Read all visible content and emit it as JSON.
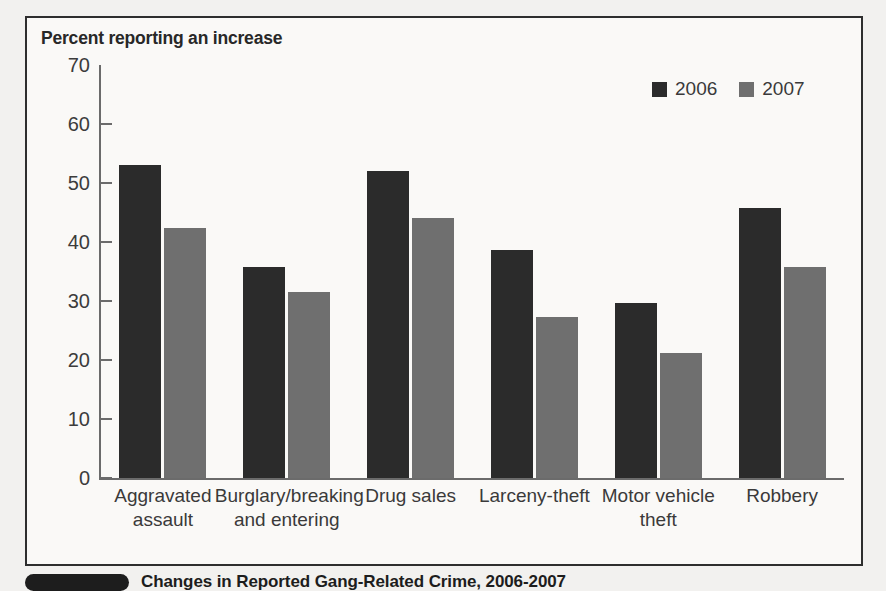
{
  "figure": {
    "plot_title": "Percent reporting an increase",
    "caption": "Changes in Reported Gang-Related Crime, 2006-2007"
  },
  "legend": {
    "items": [
      {
        "label": "2006",
        "color": "#2b2b2b",
        "icon": "square-swatch"
      },
      {
        "label": "2007",
        "color": "#6f6f6f",
        "icon": "square-swatch"
      }
    ]
  },
  "chart_data": {
    "type": "bar",
    "title": "Percent reporting an increase",
    "xlabel": "",
    "ylabel": "Percent reporting an increase",
    "ylim": [
      0,
      70
    ],
    "yticks": [
      0,
      10,
      20,
      30,
      40,
      50,
      60,
      70
    ],
    "ytick_labels": [
      "0",
      "10",
      "20",
      "30",
      "40",
      "50",
      "60",
      "70"
    ],
    "grid": false,
    "legend_position": "top-right",
    "categories": [
      "Aggravated assault",
      "Burglary/breaking and entering",
      "Drug sales",
      "Larceny-theft",
      "Motor vehicle theft",
      "Robbery"
    ],
    "category_lines": [
      [
        "Aggravated",
        "assault"
      ],
      [
        "Burglary/breaking",
        "and entering"
      ],
      [
        "Drug sales"
      ],
      [
        "Larceny-theft"
      ],
      [
        "Motor vehicle",
        "theft"
      ],
      [
        "Robbery"
      ]
    ],
    "series": [
      {
        "name": "2006",
        "color": "#2b2b2b",
        "values": [
          53.0,
          35.7,
          52.1,
          38.6,
          29.6,
          45.8
        ]
      },
      {
        "name": "2007",
        "color": "#6f6f6f",
        "values": [
          42.4,
          31.5,
          44.1,
          27.3,
          21.2,
          35.8
        ]
      }
    ]
  }
}
